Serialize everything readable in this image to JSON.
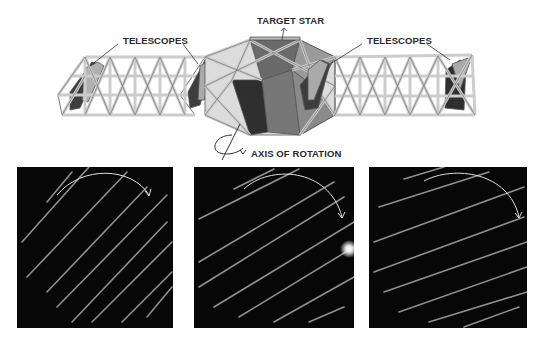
{
  "labels": {
    "telescopes_left": "TELESCOPES",
    "target_star": "TARGET STAR",
    "telescopes_right": "TELESCOPES",
    "axis_of_rotation": "AXIS OF ROTATION"
  },
  "colors": {
    "background": "#ffffff",
    "truss": "#d8d8d8",
    "truss_outline": "#555555",
    "mirror_light": "#a8a8a8",
    "mirror_dark": "#3a3a3a",
    "panel_bg": "#070707",
    "fringe": "#9a9a9a",
    "arrow": "#e8e8e8",
    "star_glow": "#ffffff"
  },
  "panels": [
    {
      "id": "panel-1",
      "description": "interference fringes, steep angle",
      "has_star": false
    },
    {
      "id": "panel-2",
      "description": "interference fringes rotated, target star visible",
      "has_star": true
    },
    {
      "id": "panel-3",
      "description": "interference fringes rotated further",
      "has_star": false
    }
  ]
}
